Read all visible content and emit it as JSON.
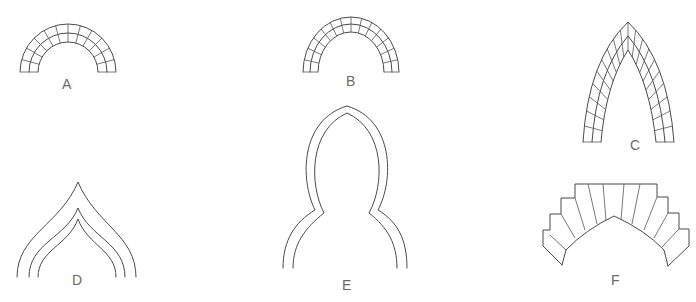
{
  "figure": {
    "stroke_color": "#4a4a4a",
    "label_color": "#6a6a6a",
    "background": "#ffffff"
  },
  "arches": [
    {
      "id": "A",
      "label": "A",
      "shape": "semicircular arch with voussoir grid, two rings"
    },
    {
      "id": "B",
      "label": "B",
      "shape": "semicircular arch with voussoir grid, two rings"
    },
    {
      "id": "C",
      "label": "C",
      "shape": "pointed (lancet) arch with voussoir grid"
    },
    {
      "id": "D",
      "label": "D",
      "shape": "ogee arch, three concentric outlines"
    },
    {
      "id": "E",
      "label": "E",
      "shape": "shouldered pointed arch outline, double line"
    },
    {
      "id": "F",
      "label": "F",
      "shape": "stepped-voussoir pointed arch"
    }
  ]
}
